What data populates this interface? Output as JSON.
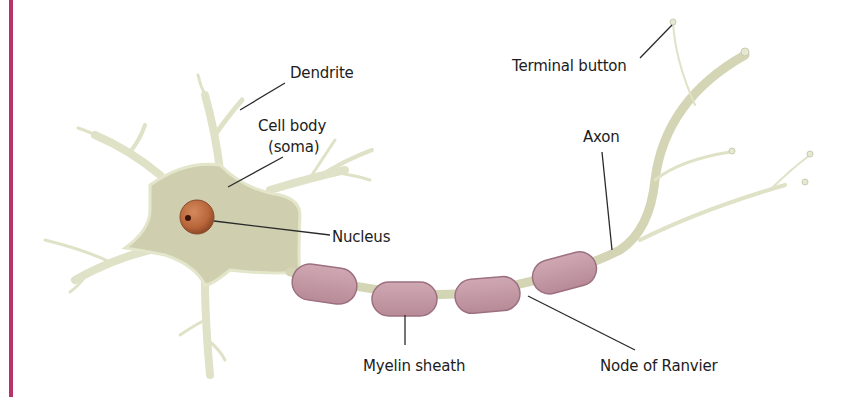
{
  "diagram": {
    "colors": {
      "accent_bar": "#b8336a",
      "cell_body": "#cfcfb0",
      "cell_outline": "#e4e6cc",
      "nucleus": "#b8653a",
      "nucleolus": "#3a1208",
      "myelin": "#c49aa6",
      "myelin_outline": "#9c7080",
      "leader_line": "#2a2a2a",
      "label_text": "#1c1c1c"
    },
    "labels": {
      "dendrite": "Dendrite",
      "cell_body_line1": "Cell body",
      "cell_body_line2": "(soma)",
      "nucleus": "Nucleus",
      "terminal_button": "Terminal button",
      "axon": "Axon",
      "myelin_sheath": "Myelin sheath",
      "node_of_ranvier": "Node of Ranvier"
    },
    "myelin_segment_count": 4
  }
}
